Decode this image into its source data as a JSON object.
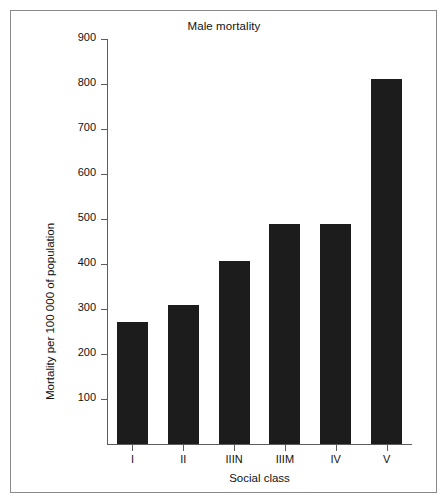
{
  "chart_data": {
    "type": "bar",
    "title": "Male mortality",
    "xlabel": "Social class",
    "ylabel": "Mortality per 100 000 of population",
    "categories": [
      "I",
      "II",
      "IIIN",
      "IIIM",
      "IV",
      "V"
    ],
    "values": [
      272,
      308,
      407,
      488,
      488,
      812
    ],
    "ylim": [
      0,
      900
    ],
    "yticks": [
      100,
      200,
      300,
      400,
      500,
      600,
      700,
      800,
      900
    ],
    "ytick_labels": [
      "100",
      "200",
      "300",
      "400",
      "500",
      "600",
      "700",
      "800",
      "900"
    ],
    "grid": false,
    "legend": false,
    "bar_color": "#1c1c1c",
    "axis_color": "#5c5c5c",
    "frame_color": "#8a8a8a",
    "text_color": "#111111"
  }
}
